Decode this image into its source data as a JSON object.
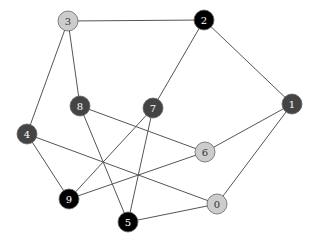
{
  "graph": {
    "width": 314,
    "height": 243,
    "node_radius": 10,
    "colors": {
      "light": "#cccccc",
      "dark": "#444444",
      "black": "#000000",
      "edge": "#555555",
      "stroke": "#666666"
    },
    "nodes": [
      {
        "id": "0",
        "label": "0",
        "x": 217,
        "y": 204,
        "style": "light"
      },
      {
        "id": "1",
        "label": "1",
        "x": 292,
        "y": 104,
        "style": "dark"
      },
      {
        "id": "2",
        "label": "2",
        "x": 204,
        "y": 20,
        "style": "black"
      },
      {
        "id": "3",
        "label": "3",
        "x": 68,
        "y": 21,
        "style": "light"
      },
      {
        "id": "4",
        "label": "4",
        "x": 27,
        "y": 134,
        "style": "dark"
      },
      {
        "id": "5",
        "label": "5",
        "x": 128,
        "y": 222,
        "style": "black"
      },
      {
        "id": "6",
        "label": "6",
        "x": 205,
        "y": 152,
        "style": "light"
      },
      {
        "id": "7",
        "label": "7",
        "x": 153,
        "y": 108,
        "style": "dark"
      },
      {
        "id": "8",
        "label": "8",
        "x": 80,
        "y": 106,
        "style": "dark"
      },
      {
        "id": "9",
        "label": "9",
        "x": 69,
        "y": 199,
        "style": "black"
      }
    ],
    "edges": [
      [
        "3",
        "2"
      ],
      [
        "3",
        "4"
      ],
      [
        "3",
        "8"
      ],
      [
        "2",
        "7"
      ],
      [
        "2",
        "1"
      ],
      [
        "8",
        "6"
      ],
      [
        "8",
        "5"
      ],
      [
        "7",
        "9"
      ],
      [
        "7",
        "5"
      ],
      [
        "4",
        "9"
      ],
      [
        "4",
        "0"
      ],
      [
        "9",
        "6"
      ],
      [
        "6",
        "1"
      ],
      [
        "1",
        "0"
      ],
      [
        "5",
        "0"
      ]
    ]
  }
}
